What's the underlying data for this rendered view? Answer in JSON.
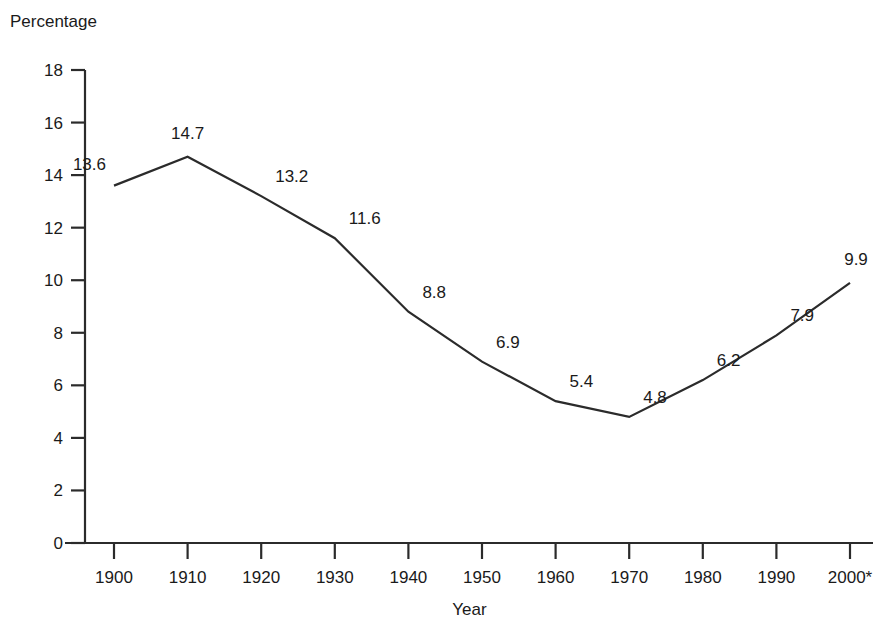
{
  "chart_data": {
    "type": "line",
    "title": "",
    "xlabel": "Year",
    "ylabel": "Percentage",
    "categories": [
      "1900",
      "1910",
      "1920",
      "1930",
      "1940",
      "1950",
      "1960",
      "1970",
      "1980",
      "1990",
      "2000*"
    ],
    "x": [
      1900,
      1910,
      1920,
      1930,
      1940,
      1950,
      1960,
      1970,
      1980,
      1990,
      2000
    ],
    "values": [
      13.6,
      14.7,
      13.2,
      11.6,
      8.8,
      6.9,
      5.4,
      4.8,
      6.2,
      7.9,
      9.9
    ],
    "point_labels": [
      "13.6",
      "14.7",
      "13.2",
      "11.6",
      "8.8",
      "6.9",
      "5.4",
      "4.8",
      "6.2",
      "7.9",
      "9.9"
    ],
    "series": [
      {
        "name": "Percentage",
        "values": [
          13.6,
          14.7,
          13.2,
          11.6,
          8.8,
          6.9,
          5.4,
          4.8,
          6.2,
          7.9,
          9.9
        ]
      }
    ],
    "ylim": [
      0,
      18
    ],
    "xlim": [
      1900,
      2000
    ],
    "ytick_labels": [
      "0",
      "2",
      "4",
      "6",
      "8",
      "10",
      "12",
      "14",
      "16",
      "18"
    ],
    "yticks": [
      0,
      2,
      4,
      6,
      8,
      10,
      12,
      14,
      16,
      18
    ],
    "grid": false,
    "legend": false,
    "legend_position": "none",
    "line_color": "#2b2b2b",
    "background_color": "#ffffff",
    "annotations": [
      "2000* denotes a provisional or estimated value"
    ]
  },
  "axes": {
    "y_title": "Percentage",
    "x_title": "Year"
  }
}
